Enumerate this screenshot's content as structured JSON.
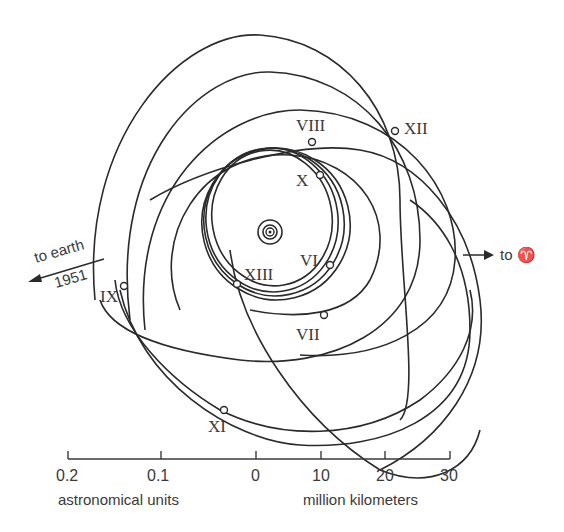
{
  "figure": {
    "center_symbol": "jupiter",
    "satellites": [
      {
        "label": "VI"
      },
      {
        "label": "VII"
      },
      {
        "label": "VIII"
      },
      {
        "label": "IX"
      },
      {
        "label": "X"
      },
      {
        "label": "XI"
      },
      {
        "label": "XII"
      },
      {
        "label": "XIII"
      }
    ],
    "direction_labels": {
      "earth_top": "to earth",
      "earth_bottom": "1951",
      "aries": "to ♈"
    },
    "scale": {
      "ticks": [
        "0.2",
        "0.1",
        "0",
        "10",
        "20",
        "30"
      ],
      "left_unit": "astronomical units",
      "right_unit": "million kilometers"
    }
  }
}
